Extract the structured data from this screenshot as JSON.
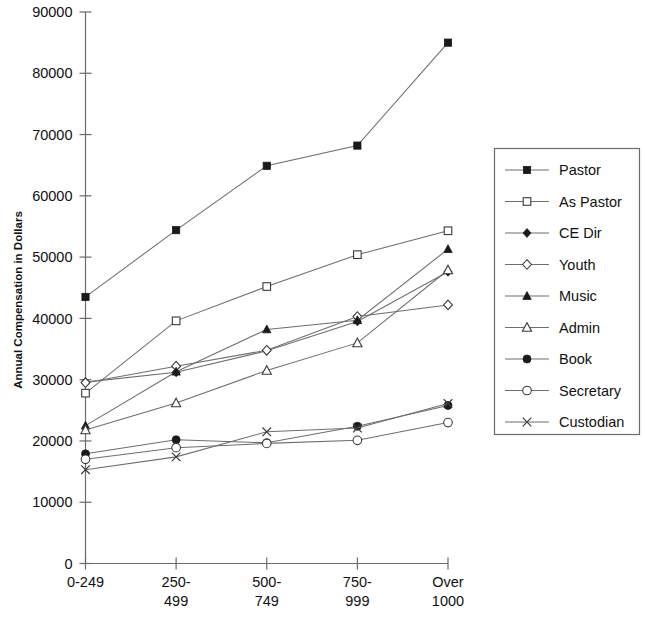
{
  "chart_data": {
    "type": "line",
    "title": "",
    "xlabel": "",
    "ylabel": "Annual Compensation in Dollars",
    "categories": [
      "0-249",
      "250-499",
      "500-749",
      "750-999",
      "Over 1000"
    ],
    "ylim": [
      0,
      90000
    ],
    "ytick_labels": [
      "0",
      "10000",
      "20000",
      "30000",
      "40000",
      "50000",
      "60000",
      "70000",
      "80000",
      "90000"
    ],
    "ytick_values": [
      0,
      10000,
      20000,
      30000,
      40000,
      50000,
      60000,
      70000,
      80000,
      90000
    ],
    "grid": false,
    "legend_position": "right",
    "series": [
      {
        "name": "Pastor",
        "marker": "filled-square",
        "values": [
          43500,
          54400,
          64900,
          68200,
          85000
        ]
      },
      {
        "name": "As Pastor",
        "marker": "open-square",
        "values": [
          27800,
          39600,
          45200,
          50400,
          54300
        ]
      },
      {
        "name": "CE Dir",
        "marker": "filled-diamond",
        "values": [
          29600,
          31200,
          34700,
          39500,
          47600
        ]
      },
      {
        "name": "Youth",
        "marker": "open-diamond",
        "values": [
          29500,
          32200,
          34800,
          40300,
          42200
        ]
      },
      {
        "name": "Music",
        "marker": "filled-triangle",
        "values": [
          22500,
          31300,
          38200,
          39700,
          51300
        ]
      },
      {
        "name": "Admin",
        "marker": "open-triangle",
        "values": [
          21800,
          26200,
          31500,
          36000,
          47900
        ]
      },
      {
        "name": "Book",
        "marker": "filled-circle",
        "values": [
          17900,
          20200,
          19700,
          22400,
          25800
        ]
      },
      {
        "name": "Secretary",
        "marker": "open-circle",
        "values": [
          17000,
          18900,
          19600,
          20100,
          23000
        ]
      },
      {
        "name": "Custodian",
        "marker": "cross",
        "values": [
          15300,
          17400,
          21500,
          22100,
          26100
        ]
      }
    ]
  },
  "legend": {
    "items": [
      {
        "label": "Pastor"
      },
      {
        "label": "As Pastor"
      },
      {
        "label": "CE Dir"
      },
      {
        "label": "Youth"
      },
      {
        "label": "Music"
      },
      {
        "label": "Admin"
      },
      {
        "label": "Book"
      },
      {
        "label": "Secretary"
      },
      {
        "label": "Custodian"
      }
    ]
  }
}
